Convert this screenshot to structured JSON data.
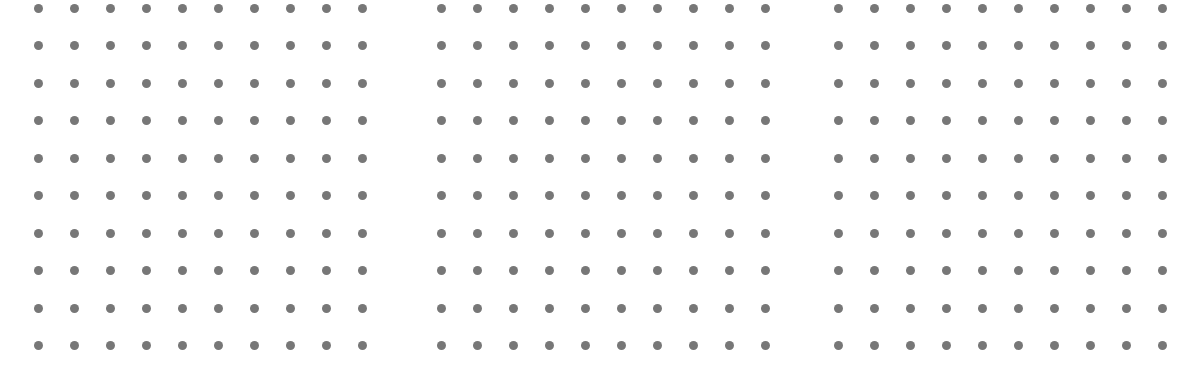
{
  "canvas": {
    "width": 1204,
    "height": 375,
    "background": "#ffffff"
  },
  "dot_style": {
    "color": "#777777",
    "diameter": 9
  },
  "grids": [
    {
      "name": "left-dot-grid",
      "origin_x": 38,
      "origin_y": 8,
      "cols": 10,
      "rows": 10,
      "col_spacing": 36,
      "row_spacing": 37.5
    },
    {
      "name": "middle-dot-grid",
      "origin_x": 441,
      "origin_y": 8,
      "cols": 10,
      "rows": 10,
      "col_spacing": 36,
      "row_spacing": 37.5
    },
    {
      "name": "right-dot-grid",
      "origin_x": 838,
      "origin_y": 8,
      "cols": 10,
      "rows": 10,
      "col_spacing": 36,
      "row_spacing": 37.5
    }
  ]
}
